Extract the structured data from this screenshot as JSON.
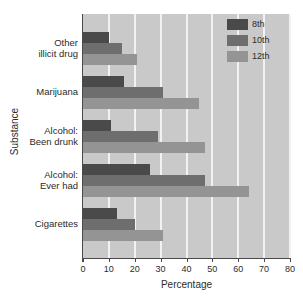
{
  "chart_data": {
    "type": "bar",
    "orientation": "horizontal",
    "title": "",
    "xlabel": "Percentage",
    "ylabel": "Substance",
    "xlim": [
      0,
      80
    ],
    "xticks": [
      0,
      10,
      20,
      30,
      40,
      50,
      60,
      70,
      80
    ],
    "grid": "vertical-white",
    "legend_position": "top-right",
    "categories": [
      "Cigarettes",
      "Alcohol:\nEver had",
      "Alcohol:\nBeen drunk",
      "Marijuana",
      "Other\nillicit drug"
    ],
    "category_lines": [
      [
        "Cigarettes"
      ],
      [
        "Alcohol:",
        "Ever had"
      ],
      [
        "Alcohol:",
        "Been drunk"
      ],
      [
        "Marijuana"
      ],
      [
        "Other",
        "illicit drug"
      ]
    ],
    "series": [
      {
        "name": "8th",
        "color": "#4a4a4a",
        "values": [
          13,
          26,
          11,
          16,
          10
        ]
      },
      {
        "name": "10th",
        "color": "#6e6e6e",
        "values": [
          20,
          47,
          29,
          31,
          15
        ]
      },
      {
        "name": "12th",
        "color": "#949494",
        "values": [
          31,
          64,
          47,
          45,
          21
        ]
      }
    ]
  },
  "legend": {
    "entries": [
      {
        "label": "8th",
        "color": "#4a4a4a"
      },
      {
        "label": "10th",
        "color": "#6e6e6e"
      },
      {
        "label": "12th",
        "color": "#949494"
      }
    ]
  },
  "axes": {
    "x_title": "Percentage",
    "y_title": "Substance",
    "x_tick_labels": [
      "0",
      "10",
      "20",
      "30",
      "40",
      "50",
      "60",
      "70",
      "80"
    ]
  },
  "colors": {
    "plot_background": "#c9c9c9",
    "gridline": "#f2f2f2",
    "axis": "#4a4a4a",
    "text": "#2b2b2b",
    "page_background": "#ffffff"
  }
}
